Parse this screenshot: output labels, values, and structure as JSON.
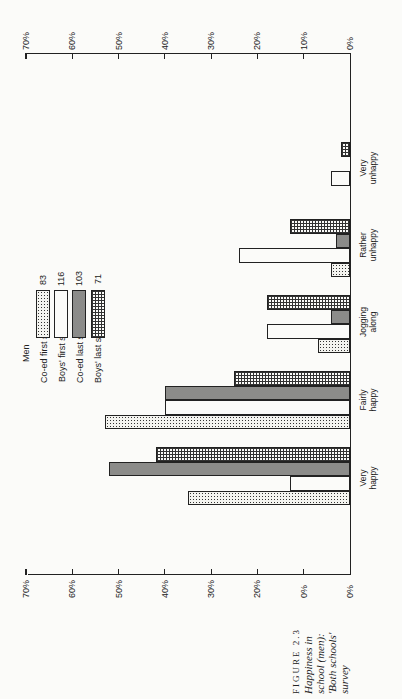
{
  "caption": {
    "figure": "FIGURE 2.3",
    "line1": "Happiness in",
    "line2": "school (men):",
    "line3": "'Both schools'",
    "line4": "survey"
  },
  "legend": {
    "title": "Men",
    "items": [
      {
        "label": "Co-ed first schools",
        "n": "83",
        "pattern": "dotted"
      },
      {
        "label": "Boys' first school",
        "n": "116",
        "pattern": "white"
      },
      {
        "label": "Co-ed last schools",
        "n": "103",
        "pattern": "gray-stipple"
      },
      {
        "label": "Boys' last schools",
        "n": "71",
        "pattern": "grid"
      }
    ]
  },
  "top_axis": {
    "ticks": [
      "70%",
      "60%",
      "50%",
      "40%",
      "30%",
      "20%",
      "10%",
      "0%"
    ]
  },
  "bottom_axis": {
    "ticks": [
      "70%",
      "60%",
      "50%",
      "40%",
      "30%",
      "20%",
      "0%",
      "0%"
    ]
  },
  "categories": [
    {
      "line1": "Very",
      "line2": "unhappy"
    },
    {
      "line1": "Rather",
      "line2": "unhappy"
    },
    {
      "line1": "Jogging",
      "line2": "along"
    },
    {
      "line1": "Fairly",
      "line2": "happy"
    },
    {
      "line1": "Very",
      "line2": "happy"
    }
  ],
  "chart_data": {
    "type": "bar",
    "orientation": "horizontal (printed rotated 90°)",
    "title": "FIGURE 2.3 Happiness in school (men): 'Both schools' survey",
    "categories": [
      "Very happy",
      "Fairly happy",
      "Jogging along",
      "Rather unhappy",
      "Very unhappy"
    ],
    "series": [
      {
        "name": "Co-ed first schools",
        "n": 83,
        "values": [
          35,
          53,
          7,
          4,
          0
        ]
      },
      {
        "name": "Boys' first school",
        "n": 116,
        "values": [
          13,
          40,
          18,
          24,
          4
        ]
      },
      {
        "name": "Co-ed last schools",
        "n": 103,
        "values": [
          52,
          40,
          4,
          3,
          0
        ]
      },
      {
        "name": "Boys' last schools",
        "n": 71,
        "values": [
          42,
          25,
          18,
          13,
          2
        ]
      }
    ],
    "xlabel": "",
    "ylabel": "Percentage",
    "ylim": [
      0,
      70
    ],
    "tick_step": 10,
    "legend_title": "Men",
    "grid": false
  }
}
